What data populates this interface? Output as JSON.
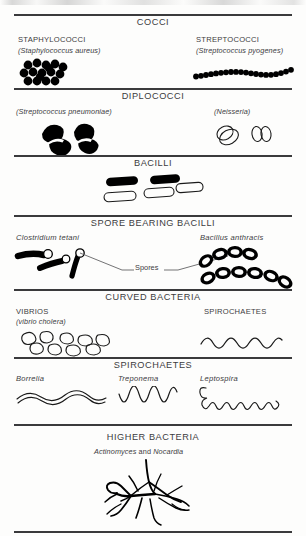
{
  "page": {
    "ink_color": "#000000",
    "rule_color": "#58595b",
    "background": "#fdfdfc"
  },
  "sections": [
    {
      "id": "cocci",
      "title": "COCCI",
      "entries": [
        {
          "id": "staphylococci",
          "genus": "STAPHYLOCOCCI",
          "species": "(Staphylococcus aureus)",
          "morphology": "irregular grape-like cluster of filled round cocci",
          "fill": "solid"
        },
        {
          "id": "streptococci",
          "genus": "STREPTOCOCCI",
          "species": "(Streptococcus pyogenes)",
          "morphology": "long sinuous chain of filled round cocci",
          "fill": "solid"
        }
      ]
    },
    {
      "id": "diplococci",
      "title": "DIPLOCOCCI",
      "entries": [
        {
          "id": "pneumococci",
          "genus": "",
          "species": "(Streptococcus pneumoniae)",
          "morphology": "two lancet-shaped pairs, solid filled with capsule notch",
          "fill": "solid"
        },
        {
          "id": "neisseria",
          "genus": "",
          "species": "(Neisseria)",
          "morphology": "two kidney-bean pairs, outline only",
          "fill": "outline"
        }
      ]
    },
    {
      "id": "bacilli",
      "title": "BACILLI",
      "entries": [
        {
          "id": "bacilli-rods",
          "genus": "",
          "species": "",
          "morphology": "two solid rods above, three outlined rods below",
          "fill": "mixed"
        }
      ]
    },
    {
      "id": "spore-bearing-bacilli",
      "title": "SPORE BEARING BACILLI",
      "annotation": "Spores",
      "entries": [
        {
          "id": "clostridium",
          "genus": "Clostridium tetani",
          "species": "",
          "morphology": "three drumstick rods with terminal round spores",
          "fill": "solid"
        },
        {
          "id": "bacillus-anthracis",
          "genus": "Bacillus anthracis",
          "species": "",
          "morphology": "two chains of thick-walled ovals with pale central spores",
          "fill": "solid-with-void"
        }
      ]
    },
    {
      "id": "curved-bacteria",
      "title": "CURVED BACTERIA",
      "entries": [
        {
          "id": "vibrios",
          "genus": "VIBRIOS",
          "species": "(vibrio cholera)",
          "morphology": "scattered comma-shaped outlined cells",
          "fill": "outline"
        },
        {
          "id": "spirochaetes-curved",
          "genus": "SPIROCHAETES",
          "species": "",
          "morphology": "regular zig-zag wave filament",
          "fill": "outline"
        }
      ]
    },
    {
      "id": "spirochaetes",
      "title": "SPIROCHAETES",
      "entries": [
        {
          "id": "borrelia",
          "genus": "Borrelia",
          "species": "",
          "morphology": "few irregular open waves, thick double-line body",
          "fill": "outline"
        },
        {
          "id": "treponema",
          "genus": "Treponema",
          "species": "",
          "morphology": "regular tight spiral coils",
          "fill": "outline"
        },
        {
          "id": "leptospira",
          "genus": "Leptospira",
          "species": "",
          "morphology": "fine tight coils with hooked ends",
          "fill": "outline"
        }
      ]
    },
    {
      "id": "higher-bacteria",
      "title": "HIGHER BACTERIA",
      "entries": [
        {
          "id": "actinomyces-nocardia",
          "genus_part1": "Actinomyces",
          "conjunction": "and",
          "genus_part2": "Nocardia",
          "morphology": "branching filamentous mycelial mass",
          "fill": "solid"
        }
      ]
    }
  ]
}
